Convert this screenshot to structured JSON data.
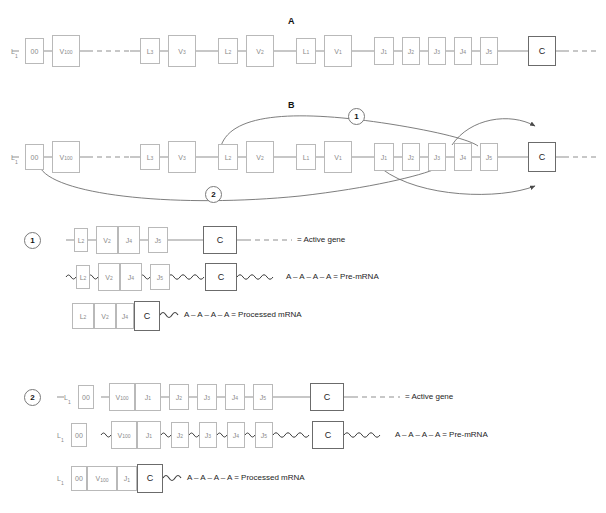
{
  "figure": {
    "type": "gene-rearrangement-splicing-diagram",
    "panels": [
      {
        "id": "A",
        "label": "A"
      },
      {
        "id": "B",
        "label": "B"
      }
    ]
  },
  "panelA": {
    "label": "A",
    "segments": [
      {
        "name": "L100",
        "display": "L",
        "sub": "1",
        "boxtext": "00",
        "kind": "L-split"
      },
      {
        "name": "V100",
        "display": "V",
        "sub": "100",
        "kind": "V"
      },
      {
        "name": "gap",
        "kind": "dashed"
      },
      {
        "name": "L3",
        "display": "L",
        "sub": "3",
        "kind": "L"
      },
      {
        "name": "V3",
        "display": "V",
        "sub": "3",
        "kind": "V"
      },
      {
        "name": "L2",
        "display": "L",
        "sub": "2",
        "kind": "L"
      },
      {
        "name": "V2",
        "display": "V",
        "sub": "2",
        "kind": "V"
      },
      {
        "name": "L1",
        "display": "L",
        "sub": "1",
        "kind": "L"
      },
      {
        "name": "V1",
        "display": "V",
        "sub": "1",
        "kind": "V"
      },
      {
        "name": "J1",
        "display": "J",
        "sub": "1",
        "kind": "J"
      },
      {
        "name": "J2",
        "display": "J",
        "sub": "2",
        "kind": "J"
      },
      {
        "name": "J3",
        "display": "J",
        "sub": "3",
        "kind": "J"
      },
      {
        "name": "J4",
        "display": "J",
        "sub": "4",
        "kind": "J"
      },
      {
        "name": "J5",
        "display": "J",
        "sub": "5",
        "kind": "J"
      },
      {
        "name": "C",
        "display": "C",
        "sub": "",
        "kind": "C"
      }
    ]
  },
  "panelB": {
    "label": "B",
    "arc_labels": [
      "1",
      "2"
    ],
    "segments": [
      {
        "name": "L100",
        "display": "L",
        "sub": "1",
        "boxtext": "00",
        "kind": "L-split"
      },
      {
        "name": "V100",
        "display": "V",
        "sub": "100",
        "kind": "V"
      },
      {
        "name": "gap",
        "kind": "dashed"
      },
      {
        "name": "L3",
        "display": "L",
        "sub": "3",
        "kind": "L"
      },
      {
        "name": "V3",
        "display": "V",
        "sub": "3",
        "kind": "V"
      },
      {
        "name": "L2",
        "display": "L",
        "sub": "2",
        "kind": "L"
      },
      {
        "name": "V2",
        "display": "V",
        "sub": "2",
        "kind": "V"
      },
      {
        "name": "L1",
        "display": "L",
        "sub": "1",
        "kind": "L"
      },
      {
        "name": "V1",
        "display": "V",
        "sub": "1",
        "kind": "V"
      },
      {
        "name": "J1",
        "display": "J",
        "sub": "1",
        "kind": "J"
      },
      {
        "name": "J2",
        "display": "J",
        "sub": "2",
        "kind": "J"
      },
      {
        "name": "J3",
        "display": "J",
        "sub": "3",
        "kind": "J"
      },
      {
        "name": "J4",
        "display": "J",
        "sub": "4",
        "kind": "J"
      },
      {
        "name": "J5",
        "display": "J",
        "sub": "5",
        "kind": "J"
      },
      {
        "name": "C",
        "display": "C",
        "sub": "",
        "kind": "C"
      }
    ]
  },
  "section1": {
    "number": "1",
    "rows": [
      {
        "id": "active-gene",
        "legend": "= Active gene",
        "boxes": [
          {
            "display": "L",
            "sub": "2"
          },
          {
            "display": "V",
            "sub": "2"
          },
          {
            "display": "J",
            "sub": "4"
          },
          {
            "display": "J",
            "sub": "5"
          },
          {
            "display": "C",
            "sub": ""
          }
        ]
      },
      {
        "id": "pre-mrna",
        "legend": "A – A – A – A = Pre-mRNA",
        "boxes": [
          {
            "display": "L",
            "sub": "2"
          },
          {
            "display": "V",
            "sub": "2"
          },
          {
            "display": "J",
            "sub": "4"
          },
          {
            "display": "J",
            "sub": "5"
          },
          {
            "display": "C",
            "sub": ""
          }
        ]
      },
      {
        "id": "processed-mrna",
        "legend": "A – A – A – A = Processed mRNA",
        "boxes": [
          {
            "display": "L",
            "sub": "2"
          },
          {
            "display": "V",
            "sub": "2"
          },
          {
            "display": "J",
            "sub": "4"
          },
          {
            "display": "C",
            "sub": ""
          }
        ]
      }
    ]
  },
  "section2": {
    "number": "2",
    "rows": [
      {
        "id": "active-gene",
        "legend": "= Active gene",
        "boxes": [
          {
            "display": "L",
            "sub": "1",
            "boxtext": "00"
          },
          {
            "display": "V",
            "sub": "100"
          },
          {
            "display": "J",
            "sub": "1"
          },
          {
            "display": "J",
            "sub": "2"
          },
          {
            "display": "J",
            "sub": "3"
          },
          {
            "display": "J",
            "sub": "4"
          },
          {
            "display": "J",
            "sub": "5"
          },
          {
            "display": "C",
            "sub": ""
          }
        ]
      },
      {
        "id": "pre-mrna",
        "legend": "A – A – A – A = Pre-mRNA",
        "boxes": [
          {
            "display": "L",
            "sub": "1",
            "boxtext": "00"
          },
          {
            "display": "V",
            "sub": "100"
          },
          {
            "display": "J",
            "sub": "1"
          },
          {
            "display": "J",
            "sub": "2"
          },
          {
            "display": "J",
            "sub": "3"
          },
          {
            "display": "J",
            "sub": "4"
          },
          {
            "display": "J",
            "sub": "5"
          },
          {
            "display": "C",
            "sub": ""
          }
        ]
      },
      {
        "id": "processed-mrna",
        "legend": "A – A – A – A = Processed mRNA",
        "boxes": [
          {
            "display": "L",
            "sub": "1",
            "boxtext": "00"
          },
          {
            "display": "V",
            "sub": "100"
          },
          {
            "display": "J",
            "sub": "1"
          },
          {
            "display": "C",
            "sub": ""
          }
        ]
      }
    ]
  },
  "colors": {
    "box_border": "#b9b9b9",
    "c_border": "#6b6b6b",
    "line": "#8f8f8f",
    "arc": "#6f6f6f",
    "text": "#1d1d1d",
    "box_text": "#8a8a8a",
    "background": "#ffffff"
  }
}
